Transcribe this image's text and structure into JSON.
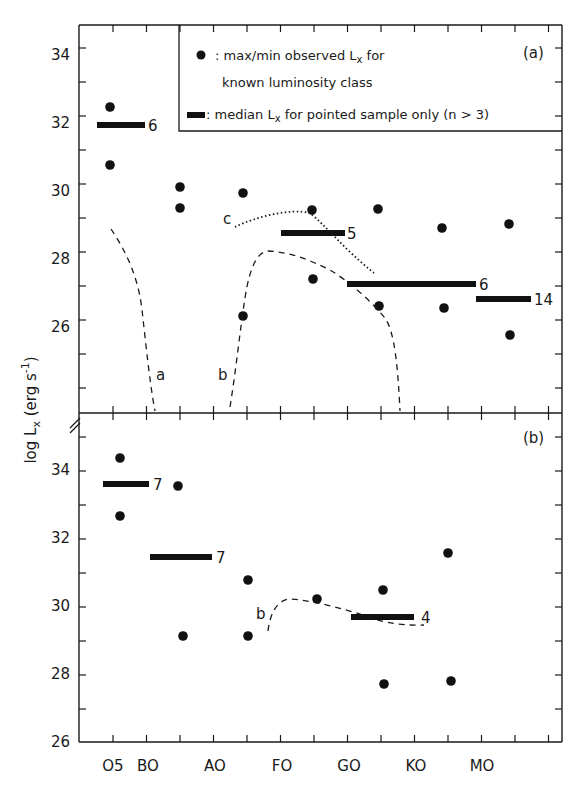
{
  "figure": {
    "ylabel": "log L",
    "ylabel_sub": "x",
    "ylabel_units": " (erg s",
    "ylabel_exp": "-1",
    "ylabel_close": ")",
    "xtick_labels": [
      "O5",
      "BO",
      "AO",
      "FO",
      "GO",
      "KO",
      "MO"
    ]
  },
  "legend": {
    "dot_text_line1": ": max/min observed L",
    "dot_text_line1_sub": "x",
    "dot_text_line1_end": " for",
    "dot_text_line2": "known luminosity class",
    "bar_text": ": median L",
    "bar_text_sub": "x",
    "bar_text_end": " for pointed sample only (n > 3)"
  },
  "chart_data": [
    {
      "type": "scatter",
      "panel": "(a)",
      "title": "",
      "xlabel": "Spectral type",
      "ylabel": "log Lx (erg s^-1)",
      "xtick_labels": [
        "O5",
        "BO",
        "AO",
        "FO",
        "GO",
        "KO",
        "MO"
      ],
      "ylim": [
        24,
        35.5
      ],
      "yticks": [
        26,
        28,
        30,
        32,
        34
      ],
      "legend": [
        "max/min observed Lx for known luminosity class",
        "median Lx for pointed sample only (n>3)"
      ],
      "points": [
        {
          "x": "O5",
          "y": 33.1
        },
        {
          "x": "O5",
          "y": 31.4
        },
        {
          "x": "B5",
          "y": 30.7
        },
        {
          "x": "B5",
          "y": 30.1
        },
        {
          "x": "A5",
          "y": 30.5
        },
        {
          "x": "A5",
          "y": 26.9
        },
        {
          "x": "F5",
          "y": 30.0
        },
        {
          "x": "F5",
          "y": 28.0
        },
        {
          "x": "G5",
          "y": 30.05
        },
        {
          "x": "G5",
          "y": 27.2
        },
        {
          "x": "K5",
          "y": 29.5
        },
        {
          "x": "K5",
          "y": 27.1
        },
        {
          "x": "M5",
          "y": 29.6
        },
        {
          "x": "M5",
          "y": 26.3
        }
      ],
      "medians": [
        {
          "from": "O4",
          "to": "B0",
          "y": 32.5,
          "n": 6
        },
        {
          "from": "F2",
          "to": "F9",
          "y": 29.35,
          "n": 5
        },
        {
          "from": "F9",
          "to": "K9",
          "y": 27.85,
          "n": 6
        },
        {
          "from": "K9",
          "to": "M6",
          "y": 27.4,
          "n": 14
        }
      ],
      "curves": [
        {
          "label": "a",
          "style": "dashed",
          "points": [
            [
              0.35,
              29.5
            ],
            [
              0.9,
              28.2
            ],
            [
              1.2,
              26.5
            ],
            [
              1.45,
              24
            ]
          ]
        },
        {
          "label": "b",
          "style": "dashed",
          "points": [
            [
              3.8,
              24
            ],
            [
              4.0,
              27.0
            ],
            [
              4.4,
              28.7
            ],
            [
              5.2,
              28.4
            ],
            [
              5.8,
              27.6
            ],
            [
              6.4,
              26.8
            ],
            [
              6.6,
              24
            ]
          ]
        },
        {
          "label": "c",
          "style": "dotted",
          "points": [
            [
              4.0,
              29.5
            ],
            [
              4.4,
              29.8
            ],
            [
              5.0,
              29.95
            ],
            [
              5.5,
              29.3
            ],
            [
              6.0,
              28.5
            ],
            [
              6.2,
              28.1
            ]
          ]
        }
      ]
    },
    {
      "type": "scatter",
      "panel": "(b)",
      "title": "",
      "xlabel": "Spectral type",
      "ylabel": "log Lx (erg s^-1)",
      "xtick_labels": [
        "O5",
        "BO",
        "AO",
        "FO",
        "GO",
        "KO",
        "MO"
      ],
      "ylim": [
        26,
        35.5
      ],
      "yticks": [
        26,
        28,
        30,
        32,
        34
      ],
      "points": [
        {
          "x": "O5",
          "y": 34.3
        },
        {
          "x": "O5",
          "y": 32.6
        },
        {
          "x": "B5",
          "y": 33.5
        },
        {
          "x": "B5",
          "y": 29.1
        },
        {
          "x": "A5",
          "y": 30.7
        },
        {
          "x": "A5",
          "y": 29.1
        },
        {
          "x": "F5",
          "y": 30.2
        },
        {
          "x": "G5",
          "y": 30.4
        },
        {
          "x": "G5",
          "y": 27.7
        },
        {
          "x": "K5",
          "y": 31.5
        },
        {
          "x": "K5",
          "y": 27.75
        }
      ],
      "medians": [
        {
          "from": "O3",
          "to": "B0",
          "y": 33.55,
          "n": 7
        },
        {
          "from": "B0",
          "to": "A0",
          "y": 31.4,
          "n": 7
        },
        {
          "from": "G0",
          "to": "K0",
          "y": 29.65,
          "n": 4
        }
      ],
      "curves": [
        {
          "label": "b",
          "style": "dashed",
          "points": [
            [
              4.6,
              29.2
            ],
            [
              4.8,
              30.0
            ],
            [
              5.2,
              30.15
            ],
            [
              6.0,
              29.9
            ],
            [
              6.5,
              29.5
            ],
            [
              7.1,
              29.4
            ]
          ]
        }
      ]
    }
  ],
  "panels": {
    "a": {
      "label": "(a)",
      "yticks": [
        "34",
        "32",
        "30",
        "28",
        "26"
      ],
      "median_counts": [
        "6",
        "5",
        "6",
        "14"
      ],
      "curve_labels": [
        "a",
        "b",
        "c"
      ]
    },
    "b": {
      "label": "(b)",
      "yticks": [
        "34",
        "32",
        "30",
        "28",
        "26"
      ],
      "median_counts": [
        "7",
        "7",
        "4"
      ],
      "curve_labels": [
        "b"
      ]
    }
  }
}
